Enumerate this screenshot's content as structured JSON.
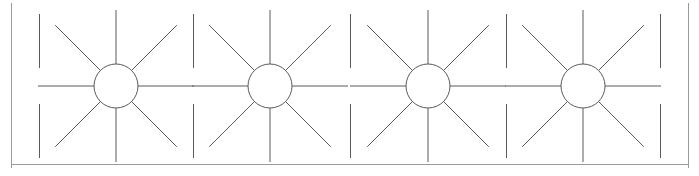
{
  "figure": {
    "type": "line-diagram",
    "width": 699,
    "height": 176,
    "background_color": "#ffffff",
    "stroke_color": "#5a5a5a",
    "stroke_width": 1,
    "border": {
      "left_x": 11,
      "right_x": 689,
      "top_y": 3,
      "bottom_y": 164,
      "sides_drawn": [
        "left",
        "right",
        "bottom"
      ],
      "color": "#9a9a9a",
      "stroke_width": 1
    },
    "axis_row_y": 86,
    "circles": {
      "count": 4,
      "radius": 22,
      "centers_x": [
        116,
        270,
        428,
        583
      ],
      "center_y": 86,
      "fill": "none"
    },
    "rays_per_circle": 8,
    "ray_angles_deg": [
      0,
      45,
      90,
      135,
      180,
      225,
      270,
      315
    ],
    "ray_lengths": {
      "horizontal": 78,
      "vertical": 76,
      "diagonal": 86
    },
    "interstitial_verticals": {
      "description": "short vertical segments midway between adjacent circles, above and below the center row",
      "x_positions": [
        193,
        350,
        506
      ],
      "top_segment": [
        14,
        68
      ],
      "bottom_segment": [
        104,
        158
      ]
    },
    "edge_verticals": {
      "description": "partial vertical segments at the left and right extremes",
      "x_positions": [
        39,
        660
      ],
      "top_segment": [
        14,
        68
      ],
      "bottom_segment": [
        104,
        158
      ]
    },
    "crossings": {
      "description": "diagonal rays from neighbouring starbursts cross to form X shapes between circles",
      "x_positions": [
        193,
        350,
        506
      ],
      "y_positions": [
        44,
        128
      ]
    }
  },
  "labels": {
    "none_visible": ""
  }
}
